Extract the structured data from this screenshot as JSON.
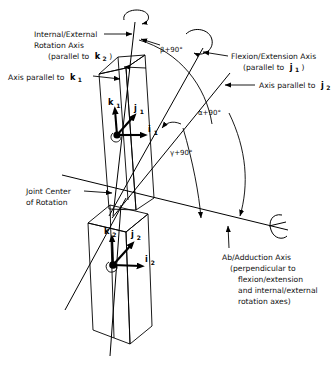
{
  "figure": {
    "background_color": "#ffffff",
    "line_color": "#000000",
    "text_color": "#111111"
  },
  "labels": {
    "internal_external_line1": "Internal/External",
    "internal_external_line2": "Rotation Axis",
    "internal_external_line3": "(parallel to",
    "internal_external_vec": "k",
    "internal_external_sub": "2",
    "internal_external_close": ")",
    "axis_parallel_k1_text": "Axis parallel to",
    "axis_parallel_k1_vec": "k",
    "axis_parallel_k1_sub": "1",
    "flexion_line1": "Flexion/Extension Axis",
    "flexion_line2": "(parallel to",
    "flexion_vec": "j",
    "flexion_sub": "1",
    "flexion_close": ")",
    "axis_parallel_j2_text": "Axis parallel to",
    "axis_parallel_j2_vec": "j",
    "axis_parallel_j2_sub": "2",
    "joint_center_line1": "Joint Center",
    "joint_center_line2": "of Rotation",
    "abduction_line1": "Ab/Adduction Axis",
    "abduction_line2": "(perpendicular to",
    "abduction_line3": "flexion/extension",
    "abduction_line4": "and internal/external",
    "abduction_line5": "rotation axes)"
  },
  "angles": {
    "beta": "β+90°",
    "alpha": "α+90°",
    "gamma": "γ+90°"
  },
  "vectors": {
    "k1_symbol": "k",
    "k1_sub": "1",
    "j1_symbol": "j",
    "j1_sub": "1",
    "i1_symbol": "i",
    "i1_sub": "1",
    "k2_symbol": "k",
    "k2_sub": "2",
    "j2_symbol": "j",
    "j2_sub": "2",
    "i2_symbol": "i",
    "i2_sub": "2"
  }
}
